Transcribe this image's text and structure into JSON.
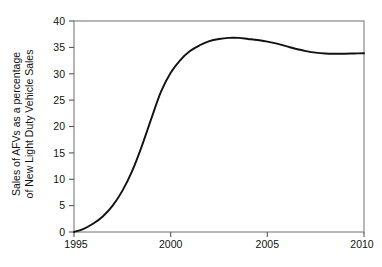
{
  "chart_data": {
    "type": "line",
    "title": "",
    "subtitle": "",
    "xlabel": "",
    "ylabel": "Sales of AFVs as a percentage of New Light Duty Vehicle Sales",
    "ylabel_lines": [
      "Sales of AFVs as a percentage",
      "of New Light Duty Vehicle Sales"
    ],
    "xlim": [
      1995,
      2010
    ],
    "ylim": [
      0,
      40
    ],
    "grid": false,
    "legend": "none",
    "y_ticks": [
      0,
      5,
      10,
      15,
      20,
      25,
      30,
      35,
      40
    ],
    "y_tick_labels": [
      "0",
      "5",
      "10",
      "15",
      "20",
      "25",
      "30",
      "35",
      "40"
    ],
    "x_ticks": [
      1995,
      2000,
      2005,
      2010
    ],
    "x_tick_labels": [
      "1995",
      "2000",
      "2005",
      "2010"
    ],
    "series": [
      {
        "name": "AFV share of new light duty vehicle sales",
        "color": "#111111",
        "x": [
          1995,
          1995.5,
          1996,
          1996.5,
          1997,
          1997.5,
          1998,
          1998.5,
          1999,
          1999.5,
          2000,
          2000.5,
          2001,
          2001.5,
          2002,
          2002.5,
          2003,
          2003.5,
          2004,
          2004.5,
          2005,
          2005.5,
          2006,
          2006.5,
          2007,
          2007.5,
          2008,
          2008.5,
          2009,
          2009.5,
          2010
        ],
        "values": [
          0.0,
          0.6,
          1.6,
          3.0,
          5.0,
          7.8,
          11.5,
          16.2,
          21.5,
          26.6,
          30.2,
          32.6,
          34.3,
          35.4,
          36.2,
          36.6,
          36.8,
          36.8,
          36.6,
          36.4,
          36.1,
          35.7,
          35.2,
          34.7,
          34.3,
          34.0,
          33.85,
          33.8,
          33.8,
          33.85,
          33.9
        ]
      }
    ]
  },
  "colors": {
    "series": "#111111",
    "frame": "#7c7c7c",
    "tick": "#555555",
    "text": "#111111",
    "background": "#ffffff"
  }
}
